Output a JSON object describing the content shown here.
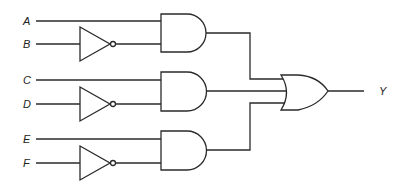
{
  "diagram": {
    "type": "logic-circuit",
    "inputs": [
      {
        "label": "A",
        "y": 21
      },
      {
        "label": "B",
        "y": 44
      },
      {
        "label": "C",
        "y": 80
      },
      {
        "label": "D",
        "y": 104
      },
      {
        "label": "E",
        "y": 139
      },
      {
        "label": "F",
        "y": 163
      }
    ],
    "output": {
      "label": "Y"
    },
    "gates": [
      {
        "id": "not1",
        "type": "NOT",
        "input": "B"
      },
      {
        "id": "not2",
        "type": "NOT",
        "input": "D"
      },
      {
        "id": "not3",
        "type": "NOT",
        "input": "F"
      },
      {
        "id": "and1",
        "type": "AND",
        "inputs": [
          "A",
          "not1"
        ]
      },
      {
        "id": "and2",
        "type": "AND",
        "inputs": [
          "C",
          "not2"
        ]
      },
      {
        "id": "and3",
        "type": "AND",
        "inputs": [
          "E",
          "not3"
        ]
      },
      {
        "id": "or1",
        "type": "OR",
        "inputs": [
          "and1",
          "and2",
          "and3"
        ],
        "output": "Y"
      }
    ],
    "colors": {
      "line": "#2a2a2a",
      "background": "#ffffff"
    }
  }
}
